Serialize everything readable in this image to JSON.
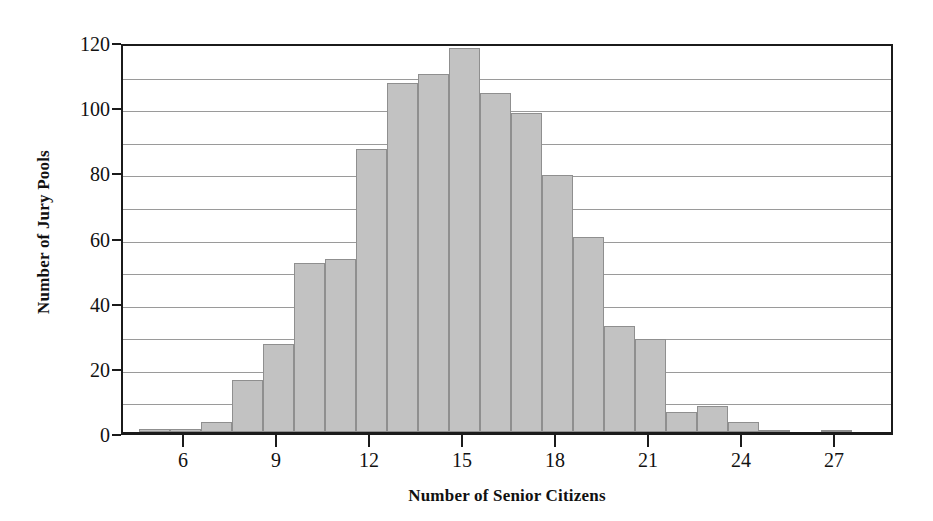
{
  "chart_data": {
    "type": "bar",
    "title": "",
    "subtitle": "",
    "xlabel": "Number of Senior Citizens",
    "ylabel": "Number of Jury Pools",
    "xlim": [
      4.0,
      28.9
    ],
    "ylim": [
      0,
      120
    ],
    "grid": "horizontal-every-10",
    "legend": "none",
    "bin_width": 1,
    "xticks": [
      6,
      9,
      12,
      15,
      18,
      21,
      24,
      27
    ],
    "xtick_labels": [
      "6",
      "9",
      "12",
      "15",
      "18",
      "21",
      "24",
      "27"
    ],
    "yticks": [
      0,
      20,
      40,
      60,
      80,
      100,
      120
    ],
    "ytick_labels": [
      "0",
      "20",
      "40",
      "60",
      "80",
      "100",
      "120"
    ],
    "gridline_values": [
      10,
      20,
      30,
      40,
      50,
      60,
      70,
      80,
      90,
      100,
      110
    ],
    "bin_starts": [
      4.5,
      5.5,
      6.5,
      7.5,
      8.5,
      9.5,
      10.5,
      11.5,
      12.5,
      13.5,
      14.5,
      15.5,
      16.5,
      17.5,
      18.5,
      19.5,
      20.5,
      21.5,
      22.5,
      23.5,
      24.5,
      25.5,
      26.5
    ],
    "categories": [
      "5",
      "6",
      "7",
      "8",
      "9",
      "10",
      "11",
      "12",
      "13",
      "14",
      "15",
      "16",
      "17",
      "18",
      "19",
      "20",
      "21",
      "22",
      "23",
      "24",
      "25",
      "26",
      "27"
    ],
    "values": [
      1,
      1,
      3,
      16,
      27,
      52,
      53,
      87,
      107,
      110,
      118,
      104,
      98,
      79,
      60,
      32.5,
      28.5,
      6,
      8,
      3,
      0.5,
      0,
      0.5
    ],
    "bar_fill_color": "#c2c2c2",
    "bar_edge_color": "#8f8f8f",
    "gridline_color": "#9a9a9a",
    "axis_color": "#1b1b1b"
  }
}
